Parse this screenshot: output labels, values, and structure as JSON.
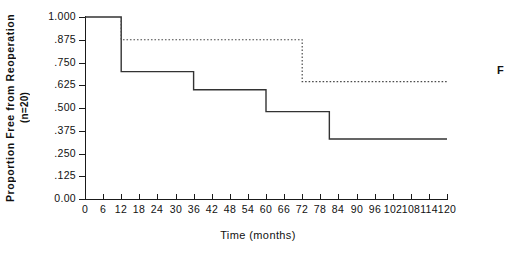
{
  "axis": {
    "y_title_line1": "Proportion Free from Reoperation",
    "y_title_line2": "(n=20)",
    "x_title": "Time (months)",
    "y_ticks": [
      "1.000",
      ".875",
      ".750",
      ".625",
      ".500",
      ".375",
      ".250",
      ".125",
      "0.00"
    ],
    "y_tick_values": [
      1.0,
      0.875,
      0.75,
      0.625,
      0.5,
      0.375,
      0.25,
      0.125,
      0.0
    ],
    "x_ticks": [
      "0",
      "6",
      "12",
      "18",
      "24",
      "30",
      "36",
      "42",
      "48",
      "54",
      "60",
      "66",
      "72",
      "78",
      "84",
      "90",
      "96",
      "102",
      "108",
      "114",
      "120"
    ],
    "x_tick_values": [
      0,
      6,
      12,
      18,
      24,
      30,
      36,
      42,
      48,
      54,
      60,
      66,
      72,
      78,
      84,
      90,
      96,
      102,
      108,
      114,
      120
    ]
  },
  "annotations": {
    "edge_label": "F"
  },
  "chart_data": {
    "type": "line",
    "title": "",
    "subtitle": "",
    "xlabel": "Time (months)",
    "ylabel": "Proportion Free from Reoperation (n=20)",
    "xlim": [
      0,
      120
    ],
    "ylim": [
      0.0,
      1.0
    ],
    "grid": false,
    "legend": null,
    "step": "post",
    "series": [
      {
        "name": "solid-curve",
        "style": "solid",
        "color": "#333333",
        "x": [
          0,
          12,
          12,
          36,
          36,
          60,
          60,
          81,
          81,
          120
        ],
        "y": [
          1.0,
          1.0,
          0.7,
          0.7,
          0.6,
          0.6,
          0.48,
          0.48,
          0.33,
          0.33
        ],
        "drops": [
          {
            "time": 12,
            "from": 1.0,
            "to": 0.7
          },
          {
            "time": 36,
            "from": 0.7,
            "to": 0.6
          },
          {
            "time": 60,
            "from": 0.6,
            "to": 0.48
          },
          {
            "time": 81,
            "from": 0.48,
            "to": 0.33
          }
        ]
      },
      {
        "name": "dotted-curve",
        "style": "dotted",
        "color": "#4a4a4a",
        "x": [
          12,
          12,
          72,
          72,
          120
        ],
        "y": [
          1.0,
          0.875,
          0.875,
          0.645,
          0.645
        ],
        "drops": [
          {
            "time": 12,
            "from": 1.0,
            "to": 0.875
          },
          {
            "time": 72,
            "from": 0.875,
            "to": 0.645
          }
        ]
      }
    ]
  }
}
